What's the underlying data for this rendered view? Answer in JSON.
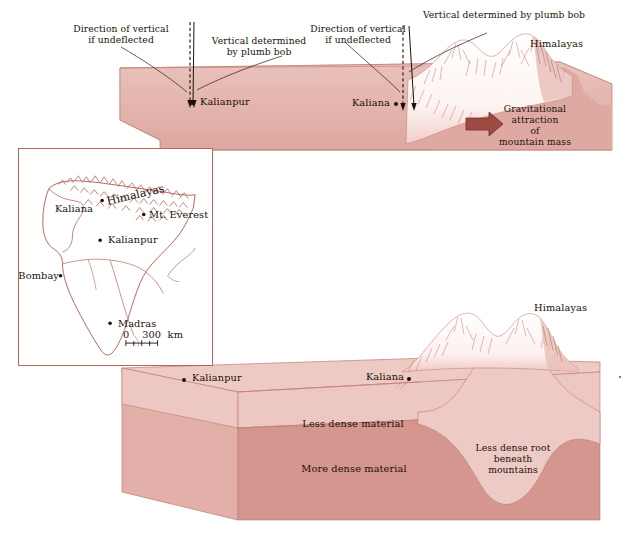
{
  "figure": {
    "palette": {
      "crust_light": "#eecac5",
      "crust_mid": "#e8bdb7",
      "crust_dark": "#d4968e",
      "crust_face": "#dba9a2",
      "outline": "#b9655c",
      "mountain_ink": "#b5685e",
      "arrow": "#9d4a42",
      "text": "#1c1108",
      "snow": "#ffffff"
    }
  },
  "upper_panel": {
    "name": "deflection-panel",
    "annotations": [
      {
        "id": "dir-vert-left",
        "text": "Direction of vertical\nif undeflected"
      },
      {
        "id": "plumb-left",
        "text": "Vertical determined\nby plumb bob"
      },
      {
        "id": "dir-vert-right",
        "text": "Direction of vertical\nif undeflected"
      },
      {
        "id": "plumb-right",
        "text": "Vertical determined by plumb bob"
      }
    ],
    "stations": [
      {
        "id": "kalianpur",
        "label": "Kalianpur"
      },
      {
        "id": "kaliana",
        "label": "Kaliana"
      }
    ],
    "range_label": "Himalayas",
    "force_label": "Gravitational\nattraction\nof\nmountain mass",
    "force_label_lines": [
      "Gravitational",
      "attraction",
      "of",
      "mountain mass"
    ]
  },
  "inset_map": {
    "name": "india-inset-map",
    "region": "India",
    "features": [
      {
        "id": "himalayas",
        "label": "Himalayas",
        "kind": "range"
      },
      {
        "id": "kaliana",
        "label": "Kaliana",
        "kind": "city"
      },
      {
        "id": "mt-everest",
        "label": "Mt. Everest",
        "kind": "peak"
      },
      {
        "id": "kalianpur",
        "label": "Kalianpur",
        "kind": "city"
      },
      {
        "id": "bombay",
        "label": "Bombay",
        "kind": "city"
      },
      {
        "id": "madras",
        "label": "Madras",
        "kind": "city"
      }
    ],
    "scale_bar": {
      "zero": "0",
      "value": "300",
      "unit": "km",
      "full": "0    300  km"
    }
  },
  "lower_panel": {
    "name": "isostasy-panel",
    "range_label": "Himalayas",
    "stations": [
      {
        "id": "kalianpur",
        "label": "Kalianpur"
      },
      {
        "id": "kaliana",
        "label": "Kaliana"
      }
    ],
    "layers": [
      {
        "id": "less-dense",
        "label": "Less dense material"
      },
      {
        "id": "more-dense",
        "label": "More dense material"
      },
      {
        "id": "root",
        "label": "Less dense root\nbeneath\nmountains",
        "lines": [
          "Less dense root",
          "beneath",
          "mountains"
        ]
      }
    ]
  }
}
